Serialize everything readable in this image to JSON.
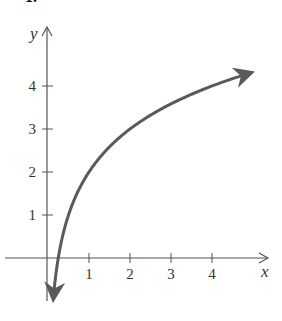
{
  "problem_number": "1.",
  "chart_data": {
    "type": "line",
    "title": "",
    "function": "y = 2 + log2(x)",
    "xlabel": "x",
    "ylabel": "y",
    "x_ticks": [
      1,
      2,
      3,
      4
    ],
    "y_ticks": [
      1,
      2,
      3,
      4
    ],
    "x_tick_labels": [
      "1",
      "2",
      "3",
      "4"
    ],
    "y_tick_labels": [
      "1",
      "2",
      "3",
      "4"
    ],
    "xlim": [
      -1.05,
      5.4
    ],
    "ylim": [
      -1,
      5.3
    ],
    "grid": false,
    "legend": "none",
    "series": [
      {
        "name": "curve",
        "color": "#5a5a5a",
        "x": [
          0.125,
          0.25,
          0.5,
          1,
          2,
          3,
          4,
          5
        ],
        "y": [
          -1,
          0,
          1,
          2,
          3,
          3.58,
          4,
          4.32
        ],
        "arrow_both_ends": true
      }
    ],
    "axis_color": "#555555"
  }
}
